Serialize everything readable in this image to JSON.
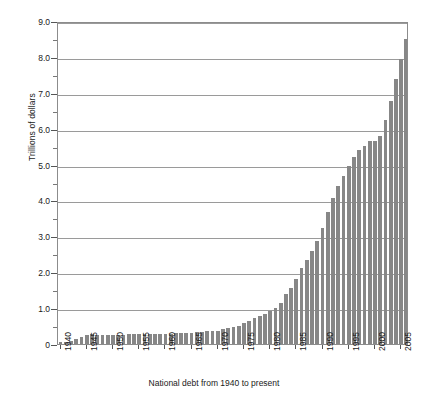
{
  "chart_data": {
    "type": "bar",
    "title": "",
    "xlabel": "National debt from 1940 to present",
    "ylabel": "Trillions of dollars",
    "ylim": [
      0,
      9.0
    ],
    "grid": true,
    "legend": null,
    "bar_color": "#878787",
    "y_major_step": 1.0,
    "y_minor_step": 0.5,
    "y_tick_labels": [
      "0",
      "1.0",
      "2.0",
      "3.0",
      "4.0",
      "5.0",
      "6.0",
      "7.0",
      "8.0",
      "9.0"
    ],
    "y_tick_values": [
      0,
      1.0,
      2.0,
      3.0,
      4.0,
      5.0,
      6.0,
      7.0,
      8.0,
      9.0
    ],
    "x_tick_labels": [
      "1940",
      "1945",
      "1950",
      "1955",
      "1960",
      "1965",
      "1970",
      "1975",
      "1980",
      "1985",
      "1990",
      "1995",
      "2000",
      "2005"
    ],
    "x_tick_values": [
      1940,
      1945,
      1950,
      1955,
      1960,
      1965,
      1970,
      1975,
      1980,
      1985,
      1990,
      1995,
      2000,
      2005
    ],
    "categories": [
      1940,
      1941,
      1942,
      1943,
      1944,
      1945,
      1946,
      1947,
      1948,
      1949,
      1950,
      1951,
      1952,
      1953,
      1954,
      1955,
      1956,
      1957,
      1958,
      1959,
      1960,
      1961,
      1962,
      1963,
      1964,
      1965,
      1966,
      1967,
      1968,
      1969,
      1970,
      1971,
      1972,
      1973,
      1974,
      1975,
      1976,
      1977,
      1978,
      1979,
      1980,
      1981,
      1982,
      1983,
      1984,
      1985,
      1986,
      1987,
      1988,
      1989,
      1990,
      1991,
      1992,
      1993,
      1994,
      1995,
      1996,
      1997,
      1998,
      1999,
      2000,
      2001,
      2002,
      2003,
      2004,
      2005,
      2006
    ],
    "values": [
      0.05,
      0.06,
      0.08,
      0.14,
      0.2,
      0.26,
      0.27,
      0.26,
      0.25,
      0.25,
      0.26,
      0.26,
      0.26,
      0.27,
      0.27,
      0.27,
      0.27,
      0.27,
      0.28,
      0.28,
      0.29,
      0.29,
      0.3,
      0.31,
      0.32,
      0.32,
      0.33,
      0.34,
      0.35,
      0.35,
      0.37,
      0.41,
      0.44,
      0.47,
      0.49,
      0.58,
      0.65,
      0.72,
      0.78,
      0.83,
      0.91,
      1.0,
      1.14,
      1.38,
      1.57,
      1.82,
      2.13,
      2.35,
      2.6,
      2.87,
      3.23,
      3.67,
      4.06,
      4.41,
      4.69,
      4.97,
      5.22,
      5.41,
      5.53,
      5.66,
      5.67,
      5.81,
      6.23,
      6.78,
      7.38,
      7.93,
      8.51
    ],
    "n_bars": 67
  }
}
